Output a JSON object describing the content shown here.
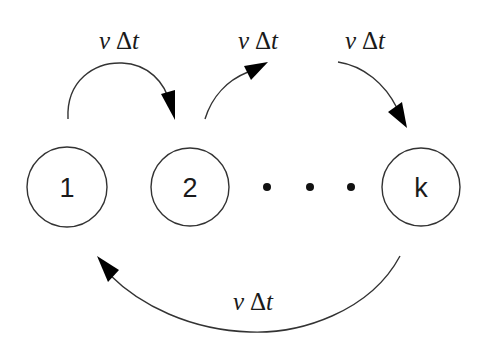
{
  "diagram": {
    "type": "state-transition-cycle",
    "states": [
      {
        "id": "1",
        "label": "1"
      },
      {
        "id": "2",
        "label": "2"
      },
      {
        "id": "k",
        "label": "k"
      }
    ],
    "ellipsis": "...",
    "transitions": [
      {
        "from": "1",
        "to": "2",
        "rate_symbol": "ν",
        "rate_delta": "Δ",
        "rate_var": "t"
      },
      {
        "from": "2",
        "to": "...",
        "rate_symbol": "ν",
        "rate_delta": "Δ",
        "rate_var": "t"
      },
      {
        "from": "...",
        "to": "k",
        "rate_symbol": "ν",
        "rate_delta": "Δ",
        "rate_var": "t"
      },
      {
        "from": "k",
        "to": "1",
        "rate_symbol": "ν",
        "rate_delta": "Δ",
        "rate_var": "t"
      }
    ],
    "colors": {
      "stroke": "#333333",
      "arrowhead": "#000000",
      "text": "#1a1a1a",
      "background": "#ffffff"
    }
  }
}
